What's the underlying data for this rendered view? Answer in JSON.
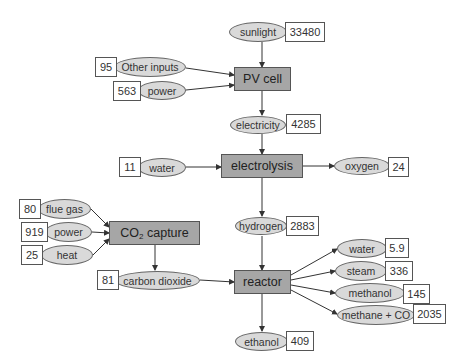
{
  "diagram": {
    "processes": {
      "pv_cell": "PV cell",
      "electrolysis": "electrolysis",
      "co2_capture_prefix": "CO",
      "co2_capture_sub": "2",
      "co2_capture_suffix": " capture",
      "reactor": "reactor"
    },
    "flows": {
      "sunlight": {
        "label": "sunlight",
        "value": "33480"
      },
      "other_inputs": {
        "label": "Other inputs",
        "value": "95"
      },
      "pv_power": {
        "label": "power",
        "value": "563"
      },
      "electricity": {
        "label": "electricity",
        "value": "4285"
      },
      "water_in": {
        "label": "water",
        "value": "11"
      },
      "oxygen": {
        "label": "oxygen",
        "value": "24"
      },
      "hydrogen": {
        "label": "hydrogen",
        "value": "2883"
      },
      "flue_gas": {
        "label": "flue gas",
        "value": "80"
      },
      "capture_power": {
        "label": "power",
        "value": "919"
      },
      "heat": {
        "label": "heat",
        "value": "25"
      },
      "carbon_dioxide": {
        "label": "carbon dioxide",
        "value": "81"
      },
      "water_out": {
        "label": "water",
        "value": "5.9"
      },
      "steam": {
        "label": "steam",
        "value": "336"
      },
      "methanol": {
        "label": "methanol",
        "value": "145"
      },
      "methane_co": {
        "label": "methane + CO",
        "value": "2035"
      },
      "ethanol": {
        "label": "ethanol",
        "value": "409"
      }
    },
    "colors": {
      "process_fill": "#a6a6a6",
      "flow_fill": "#d9d9d9",
      "value_fill": "#ffffff",
      "line": "#333333"
    }
  }
}
